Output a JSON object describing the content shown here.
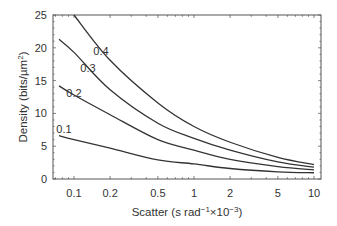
{
  "chart_data": {
    "type": "line",
    "title": "",
    "xlabel": "Scatter (s rad⁻¹×10⁻³)",
    "ylabel": "Density (bits/µm²)",
    "xscale": "log",
    "xlim": [
      0.065,
      12
    ],
    "ylim": [
      0,
      25
    ],
    "x_ticks": [
      0.1,
      0.2,
      0.5,
      1,
      2,
      5,
      10
    ],
    "x_tick_labels": [
      "0.1",
      "0.2",
      "0.5",
      "1",
      "2",
      "5",
      "10"
    ],
    "y_ticks": [
      0,
      5,
      10,
      15,
      20,
      25
    ],
    "y_tick_labels": [
      "0",
      "5",
      "10",
      "15",
      "20",
      "25"
    ],
    "grid": false,
    "legend": "inline curve labels",
    "series": [
      {
        "name": "0.4",
        "x": [
          0.1,
          0.2,
          0.5,
          1,
          2,
          5,
          10
        ],
        "y": [
          25,
          18.1,
          11.6,
          8.0,
          5.6,
          3.3,
          2.2
        ]
      },
      {
        "name": "0.3",
        "x": [
          0.075,
          0.1,
          0.2,
          0.5,
          1,
          2,
          5,
          10
        ],
        "y": [
          21.3,
          19.3,
          13.6,
          8.5,
          6.2,
          4.4,
          2.6,
          1.8
        ]
      },
      {
        "name": "0.2",
        "x": [
          0.075,
          0.1,
          0.2,
          0.5,
          1,
          2,
          5,
          10
        ],
        "y": [
          14.2,
          12.8,
          9.8,
          6.0,
          4.4,
          3.0,
          1.9,
          1.4
        ]
      },
      {
        "name": "0.1",
        "x": [
          0.075,
          0.1,
          0.2,
          0.5,
          1,
          2,
          5,
          10
        ],
        "y": [
          6.6,
          6.0,
          4.7,
          2.9,
          2.3,
          1.6,
          1.1,
          0.95
        ]
      }
    ],
    "annotations": [
      {
        "text": "0.4",
        "x": 0.2,
        "y": 19.5
      },
      {
        "text": "0.3",
        "x": 0.15,
        "y": 16.5
      },
      {
        "text": "0.2",
        "x": 0.11,
        "y": 13.0
      },
      {
        "text": "0.1",
        "x": 0.09,
        "y": 7.5
      }
    ]
  }
}
